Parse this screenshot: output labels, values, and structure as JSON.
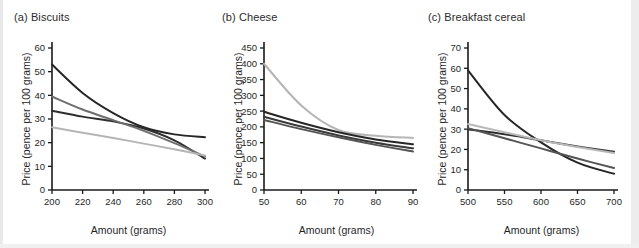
{
  "figure": {
    "background_color": "#ffffff",
    "panel_count": 3
  },
  "panels": [
    {
      "title": "(a) Biscuits",
      "xlabel": "Amount (grams)",
      "ylabel": "Price (pence per 100 grams)"
    },
    {
      "title": "(b) Cheese",
      "xlabel": "Amount (grams)",
      "ylabel": "Price (pence per 100 grams)"
    },
    {
      "title": "(c) Breakfast cereal",
      "xlabel": "Amount (grams)",
      "ylabel": "Price (pence per 100 grams)"
    }
  ],
  "chart_data": [
    {
      "type": "line",
      "title": "(a) Biscuits",
      "xlabel": "Amount (grams)",
      "ylabel": "Price (pence per 100 grams)",
      "xlim": [
        200,
        300
      ],
      "ylim": [
        0,
        60
      ],
      "xticks": [
        200,
        220,
        240,
        260,
        280,
        300
      ],
      "yticks": [
        0,
        10,
        20,
        30,
        40,
        50,
        60
      ],
      "grid": false,
      "legend": "none",
      "x": [
        200,
        220,
        240,
        260,
        280,
        300
      ],
      "series": [
        {
          "name": "curve-1",
          "color": "#262626",
          "width": 2.0,
          "values": [
            53.0,
            41.0,
            32.5,
            26.5,
            23.5,
            22.3
          ]
        },
        {
          "name": "curve-2",
          "color": "#2e2e2e",
          "width": 2.0,
          "values": [
            33.5,
            31.0,
            29.0,
            26.0,
            21.0,
            13.3
          ]
        },
        {
          "name": "curve-3",
          "color": "#6e6e6e",
          "width": 2.0,
          "values": [
            39.5,
            34.0,
            29.5,
            25.0,
            19.8,
            14.2
          ]
        },
        {
          "name": "curve-4",
          "color": "#b5b5b5",
          "width": 2.0,
          "values": [
            26.5,
            24.2,
            22.0,
            19.6,
            17.2,
            14.6
          ]
        }
      ]
    },
    {
      "type": "line",
      "title": "(b) Cheese",
      "xlabel": "Amount (grams)",
      "ylabel": "Price (pence per 100 grams)",
      "xlim": [
        50,
        90
      ],
      "ylim": [
        0,
        450
      ],
      "xticks": [
        50,
        60,
        70,
        80,
        90
      ],
      "yticks": [
        0,
        50,
        100,
        150,
        200,
        250,
        300,
        350,
        400,
        450
      ],
      "grid": false,
      "legend": "none",
      "x": [
        50,
        60,
        70,
        80,
        90
      ],
      "series": [
        {
          "name": "curve-1",
          "color": "#b5b5b5",
          "width": 2.0,
          "values": [
            400,
            268,
            190,
            172,
            165
          ]
        },
        {
          "name": "curve-2",
          "color": "#262626",
          "width": 2.0,
          "values": [
            248,
            213,
            183,
            160,
            145
          ]
        },
        {
          "name": "curve-3",
          "color": "#3a3a3a",
          "width": 2.0,
          "values": [
            232,
            201,
            173,
            150,
            132
          ]
        },
        {
          "name": "curve-4",
          "color": "#555555",
          "width": 2.0,
          "values": [
            222,
            193,
            167,
            143,
            122
          ]
        }
      ]
    },
    {
      "type": "line",
      "title": "(c) Breakfast cereal",
      "xlabel": "Amount (grams)",
      "ylabel": "Price (pence per 100 grams)",
      "xlim": [
        500,
        700
      ],
      "ylim": [
        0,
        70
      ],
      "xticks": [
        500,
        550,
        600,
        650,
        700
      ],
      "yticks": [
        0,
        10,
        20,
        30,
        40,
        50,
        60,
        70
      ],
      "grid": false,
      "legend": "none",
      "x": [
        500,
        550,
        600,
        650,
        700
      ],
      "series": [
        {
          "name": "curve-1",
          "color": "#262626",
          "width": 2.0,
          "values": [
            59.0,
            37.0,
            23.5,
            13.5,
            8.0
          ]
        },
        {
          "name": "curve-2",
          "color": "#2e2e2e",
          "width": 2.0,
          "values": [
            30.0,
            27.5,
            24.5,
            21.5,
            18.8
          ]
        },
        {
          "name": "curve-3",
          "color": "#555555",
          "width": 2.0,
          "values": [
            30.5,
            25.5,
            20.5,
            15.5,
            10.8
          ]
        },
        {
          "name": "curve-4",
          "color": "#b8b8b8",
          "width": 2.0,
          "values": [
            32.5,
            28.5,
            24.5,
            21.2,
            18.2
          ]
        }
      ]
    }
  ],
  "axis_style": {
    "line_color": "#1a1a1a",
    "tick_label_color": "#1f1f1f",
    "tick_font_size": 9.5,
    "axis_label_font_size": 10.5
  }
}
